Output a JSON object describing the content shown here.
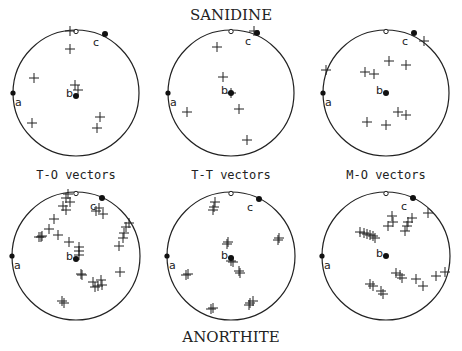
{
  "figure": {
    "top_title": "SANIDINE",
    "bottom_title": "ANORTHITE",
    "column_labels": [
      "T-O vectors",
      "T-T vectors",
      "M-O vectors"
    ],
    "axis_labels": {
      "a": "a",
      "b": "b",
      "c": "c"
    },
    "colors": {
      "ink": "#222222",
      "background": "#ffffff"
    }
  },
  "panels": [
    {
      "id": "sanidine-to",
      "cx": 76,
      "cy": 93,
      "r": 63,
      "crosses": [
        [
          -6,
          -62
        ],
        [
          -6,
          -44
        ],
        [
          -42,
          -15
        ],
        [
          -1,
          -8
        ],
        [
          2,
          -3
        ],
        [
          -44,
          30
        ],
        [
          24,
          24
        ],
        [
          21,
          35
        ]
      ],
      "axes": {
        "a": [
          -63,
          0
        ],
        "b": [
          0,
          3
        ],
        "c": [
          29,
          -59
        ]
      }
    },
    {
      "id": "sanidine-tt",
      "cx": 231,
      "cy": 93,
      "r": 63,
      "crosses": [
        [
          23,
          -62
        ],
        [
          -14,
          -46
        ],
        [
          -8,
          -16
        ],
        [
          0,
          0
        ],
        [
          8,
          16
        ],
        [
          -44,
          19
        ],
        [
          16,
          47
        ]
      ],
      "axes": {
        "a": [
          -63,
          0
        ],
        "b": [
          0,
          0
        ],
        "c": [
          26,
          -60
        ]
      }
    },
    {
      "id": "sanidine-mo",
      "cx": 386,
      "cy": 93,
      "r": 63,
      "crosses": [
        [
          38,
          -52
        ],
        [
          -60,
          -23
        ],
        [
          3,
          -32
        ],
        [
          20,
          -28
        ],
        [
          -21,
          -21
        ],
        [
          -12,
          -19
        ],
        [
          12,
          19
        ],
        [
          20,
          22
        ],
        [
          -19,
          29
        ],
        [
          0,
          32
        ]
      ],
      "axes": {
        "a": [
          -63,
          0
        ],
        "b": [
          0,
          0
        ],
        "c": [
          28,
          -60
        ]
      }
    },
    {
      "id": "anorthite-to",
      "cx": 76,
      "cy": 256,
      "r": 64,
      "crosses": [
        [
          -8,
          -62
        ],
        [
          -10,
          -58
        ],
        [
          -6,
          -54
        ],
        [
          -13,
          -50
        ],
        [
          -10,
          -46
        ],
        [
          20,
          -45
        ],
        [
          27,
          -42
        ],
        [
          23,
          -48
        ],
        [
          -22,
          -37
        ],
        [
          -27,
          -27
        ],
        [
          -35,
          -19
        ],
        [
          -34,
          -20
        ],
        [
          -37,
          -19
        ],
        [
          -18,
          -21
        ],
        [
          -7,
          -14
        ],
        [
          3,
          -9
        ],
        [
          3,
          -5
        ],
        [
          3,
          -1
        ],
        [
          50,
          -29
        ],
        [
          53,
          -33
        ],
        [
          48,
          -23
        ],
        [
          47,
          -18
        ],
        [
          43,
          -10
        ],
        [
          5,
          18
        ],
        [
          6,
          19
        ],
        [
          17,
          26
        ],
        [
          25,
          24
        ],
        [
          22,
          30
        ],
        [
          19,
          31
        ],
        [
          26,
          29
        ],
        [
          44,
          16
        ],
        [
          -14,
          45
        ],
        [
          -12,
          47
        ]
      ],
      "axes": {
        "a": [
          -64,
          0
        ],
        "b": [
          0,
          3
        ],
        "c": [
          26,
          -58
        ]
      }
    },
    {
      "id": "anorthite-tt",
      "cx": 231,
      "cy": 256,
      "r": 64,
      "crosses": [
        [
          -16,
          -54
        ],
        [
          -17,
          -49
        ],
        [
          -18,
          -46
        ],
        [
          -3,
          -14
        ],
        [
          -4,
          -12
        ],
        [
          48,
          -18
        ],
        [
          47,
          -16
        ],
        [
          0,
          5
        ],
        [
          2,
          6
        ],
        [
          8,
          15
        ],
        [
          9,
          17
        ],
        [
          -43,
          18
        ],
        [
          -45,
          19
        ],
        [
          19,
          47
        ],
        [
          22,
          45
        ],
        [
          18,
          49
        ],
        [
          -20,
          53
        ],
        [
          -18,
          52
        ]
      ],
      "axes": {
        "a": [
          -64,
          0
        ],
        "b": [
          0,
          2
        ],
        "c": [
          28,
          -57
        ]
      }
    },
    {
      "id": "anorthite-mo",
      "cx": 386,
      "cy": 256,
      "r": 64,
      "crosses": [
        [
          42,
          -43
        ],
        [
          6,
          -40
        ],
        [
          7,
          -34
        ],
        [
          2,
          -30
        ],
        [
          26,
          -38
        ],
        [
          22,
          -34
        ],
        [
          21,
          -30
        ],
        [
          19,
          -25
        ],
        [
          -26,
          -24
        ],
        [
          -22,
          -23
        ],
        [
          -19,
          -22
        ],
        [
          -16,
          -21
        ],
        [
          -13,
          -20
        ],
        [
          -11,
          -18
        ],
        [
          10,
          17
        ],
        [
          14,
          19
        ],
        [
          16,
          22
        ],
        [
          30,
          23
        ],
        [
          37,
          30
        ],
        [
          50,
          20
        ],
        [
          59,
          16
        ],
        [
          -16,
          28
        ],
        [
          -13,
          30
        ],
        [
          -5,
          35
        ],
        [
          -3,
          38
        ]
      ],
      "axes": {
        "a": [
          -64,
          0
        ],
        "b": [
          0,
          0
        ],
        "c": [
          27,
          -58
        ]
      }
    }
  ]
}
